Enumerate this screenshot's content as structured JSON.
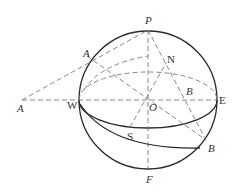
{
  "diagram": {
    "type": "celestial-sphere",
    "colors": {
      "solid_line": "#2a2a2a",
      "dashed_line": "#7a7a7a",
      "label": "#333333",
      "background": "#ffffff"
    },
    "labels": {
      "P": "P",
      "F": "F",
      "N": "N",
      "S": "S",
      "E": "E",
      "W": "W",
      "O": "O",
      "A_sphere": "A",
      "A_outside": "A",
      "B_upper": "B",
      "B_lower": "B"
    }
  }
}
